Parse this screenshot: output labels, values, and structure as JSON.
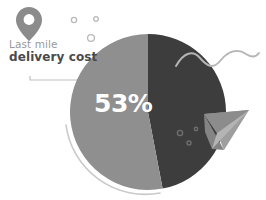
{
  "canvas": {
    "width": 266,
    "height": 200,
    "background": "#ffffff"
  },
  "label": {
    "line1": "Last mile",
    "line2": "delivery cost",
    "line1_color": "#9a9a9a",
    "line2_color": "#4a4a4a"
  },
  "icons": {
    "pin": "map-pin-icon",
    "plane": "paper-plane-icon",
    "squiggle": "wavy-line-icon",
    "connector": "leader-line-icon",
    "arc": "outline-arc-icon"
  },
  "colors": {
    "slice_light": "#8f8f8f",
    "slice_dark": "#3d3d3d",
    "pin": "#8b8b8b",
    "plane": "#9e9e9e",
    "squiggle": "#b5b5b5",
    "arc": "#c9c9c9",
    "connector": "#c0c0c0",
    "dot_outline": "#b9b9b9",
    "dot_on_dark": "#6e6e6e",
    "percent_text": "#ffffff"
  },
  "chart_data": {
    "type": "pie",
    "title": "Last mile delivery cost",
    "xlabel": "",
    "ylabel": "",
    "grid": false,
    "legend": "none",
    "center": {
      "cx": 148,
      "cy": 112
    },
    "radius": 78,
    "start_angle_deg": 0,
    "direction": "clockwise",
    "categories": [
      "Last mile delivery cost",
      "Other cost"
    ],
    "values": [
      53,
      47
    ],
    "labels": [
      "53%",
      ""
    ],
    "colors": [
      "#8f8f8f",
      "#3d3d3d"
    ],
    "annotations": [
      {
        "text": "53%",
        "x": 120,
        "y": 103,
        "color": "#ffffff"
      }
    ]
  },
  "decorations": {
    "dots_outline": [
      {
        "cx": 74,
        "cy": 20,
        "r": 2.6
      },
      {
        "cx": 96,
        "cy": 19,
        "r": 2.3
      },
      {
        "cx": 91,
        "cy": 38,
        "r": 3.4
      }
    ],
    "dots_on_dark": [
      {
        "cx": 180,
        "cy": 133,
        "r": 2.6
      },
      {
        "cx": 196,
        "cy": 129,
        "r": 1.7
      },
      {
        "cx": 189,
        "cy": 143,
        "r": 2.0
      }
    ]
  }
}
